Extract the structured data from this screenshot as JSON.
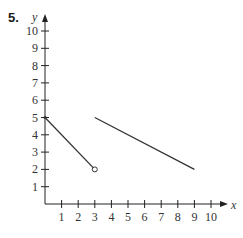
{
  "problem_number": "5.",
  "chart_data": {
    "type": "line",
    "title": "",
    "xlabel": "x",
    "ylabel": "y",
    "xlim": [
      0,
      10
    ],
    "ylim": [
      0,
      10
    ],
    "x_ticks": [
      1,
      2,
      3,
      4,
      5,
      6,
      7,
      8,
      9,
      10
    ],
    "y_ticks": [
      1,
      2,
      3,
      4,
      5,
      6,
      7,
      8,
      9,
      10
    ],
    "grid": false,
    "series": [
      {
        "name": "segment-1",
        "points": [
          [
            0,
            5
          ],
          [
            3,
            2
          ]
        ],
        "start_marker": "closed",
        "end_marker": "open"
      },
      {
        "name": "segment-2",
        "points": [
          [
            3,
            5
          ],
          [
            9,
            2
          ]
        ],
        "start_marker": "none",
        "end_marker": "none"
      }
    ]
  },
  "colors": {
    "line": "#333333",
    "axis": "#222222"
  }
}
